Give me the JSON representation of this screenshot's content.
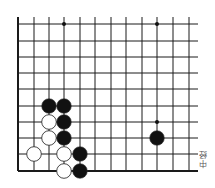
{
  "diagram": {
    "type": "go-board-fragment",
    "grid": {
      "x_lines": [
        18,
        34,
        49,
        64,
        80,
        95,
        111,
        126,
        142,
        157,
        173,
        189
      ],
      "y_lines": [
        24,
        41,
        57,
        73,
        89,
        106,
        122,
        138,
        154,
        171
      ],
      "x_extend_right": 198,
      "y_extend_top": 17,
      "edges": [
        "left",
        "bottom"
      ],
      "line_color": "#1a1a1a"
    },
    "star_points": [
      {
        "col": 3,
        "row": 0
      },
      {
        "col": 9,
        "row": 0
      },
      {
        "col": 9,
        "row": 6
      }
    ],
    "stones": [
      {
        "color": "black",
        "col": 2,
        "row": 5
      },
      {
        "color": "black",
        "col": 3,
        "row": 5
      },
      {
        "color": "white",
        "col": 2,
        "row": 6
      },
      {
        "color": "black",
        "col": 3,
        "row": 6
      },
      {
        "color": "white",
        "col": 2,
        "row": 7
      },
      {
        "color": "black",
        "col": 3,
        "row": 7
      },
      {
        "color": "white",
        "col": 1,
        "row": 8
      },
      {
        "color": "white",
        "col": 3,
        "row": 8
      },
      {
        "color": "black",
        "col": 4,
        "row": 8
      },
      {
        "color": "white",
        "col": 3,
        "row": 9
      },
      {
        "color": "black",
        "col": 4,
        "row": 9
      },
      {
        "color": "black",
        "col": 9,
        "row": 7
      }
    ],
    "stone_radius": 7.3,
    "colors": {
      "black": "#111111",
      "white": "#ffffff",
      "outline": "#333333"
    }
  },
  "caption": "中经"
}
